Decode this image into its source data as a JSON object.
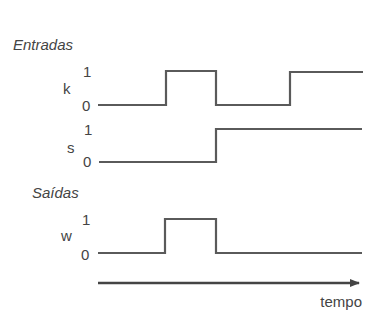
{
  "sections": {
    "inputs_label": "Entradas",
    "outputs_label": "Saídas"
  },
  "level_labels": {
    "high": "1",
    "low": "0"
  },
  "signals": [
    {
      "name": "k",
      "group": "inputs",
      "levels": [
        0,
        1,
        0,
        1
      ],
      "transitions_x": [
        166,
        216,
        290
      ]
    },
    {
      "name": "s",
      "group": "inputs",
      "levels": [
        0,
        1
      ],
      "transitions_x": [
        216
      ]
    },
    {
      "name": "w",
      "group": "outputs",
      "levels": [
        0,
        1,
        0
      ],
      "transitions_x": [
        166,
        216
      ]
    }
  ],
  "time_axis": {
    "label": "tempo",
    "direction": "right"
  },
  "colors": {
    "waveform": "#5a5a5a",
    "text": "#444444",
    "background": "#ffffff"
  }
}
